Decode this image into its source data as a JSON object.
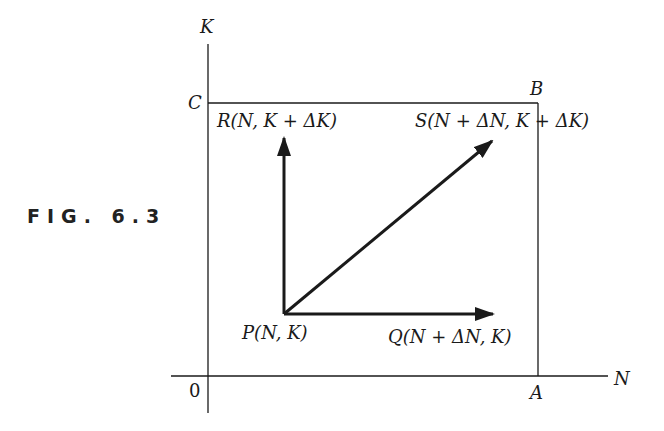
{
  "figure": {
    "caption": "FIG. 6.3",
    "axes": {
      "x_label": "N",
      "y_label": "K",
      "origin_label": "0"
    },
    "box_corners": {
      "A": "A",
      "B": "B",
      "C": "C"
    },
    "points": {
      "P": "P(N, K)",
      "Q": "Q(N + ΔN, K)",
      "R": "R(N, K + ΔK)",
      "S": "S(N + ΔN, K + ΔK)"
    },
    "colors": {
      "line": "#1a1a1a",
      "background": "#ffffff"
    }
  }
}
